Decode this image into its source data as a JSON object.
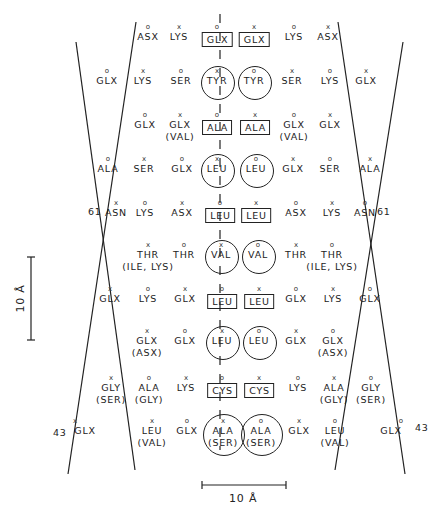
{
  "figure": {
    "type": "helical wheel / residue packing diagram (two antiparallel strands with mirror axis)",
    "marker_legend": {
      "o": "circle-marker",
      "x": "cross-marker"
    },
    "style": {
      "line_color": "#222222",
      "background": "#ffffff"
    }
  },
  "lines": {
    "left_strand_A": {
      "x1": 76,
      "y1": 42,
      "x2": 135,
      "y2": 470
    },
    "left_strand_B": {
      "x1": 136,
      "y1": 22,
      "x2": 68,
      "y2": 474
    },
    "right_strand_A": {
      "x1": 338,
      "y1": 22,
      "x2": 405,
      "y2": 474
    },
    "right_strand_B": {
      "x1": 403,
      "y1": 42,
      "x2": 335,
      "y2": 470
    },
    "center_axis": {
      "x": 220,
      "y1": 14,
      "y2": 450,
      "style": "dashed"
    }
  },
  "position_labels": {
    "left_61": "61",
    "right_61": "61",
    "left_43": "43",
    "right_43": "43"
  },
  "scale_bars": {
    "vertical": {
      "label": "10 Å",
      "x": 31,
      "y1": 257,
      "y2": 340
    },
    "horizontal": {
      "label": "10 Å",
      "x1": 202,
      "x2": 286,
      "y": 485
    }
  },
  "residues": [
    {
      "id": "r1",
      "x": 148,
      "y": 34,
      "mark": "o",
      "name": "ASX"
    },
    {
      "id": "r2",
      "x": 179,
      "y": 34,
      "mark": "x",
      "name": "LYS"
    },
    {
      "id": "r3",
      "x": 217,
      "y": 34,
      "mark": "o",
      "name": "GLX",
      "frame": "box",
      "side": "left"
    },
    {
      "id": "r4",
      "x": 254,
      "y": 34,
      "mark": "x",
      "name": "GLX",
      "frame": "box",
      "side": "right"
    },
    {
      "id": "r5",
      "x": 294,
      "y": 34,
      "mark": "o",
      "name": "LYS"
    },
    {
      "id": "r6",
      "x": 328,
      "y": 34,
      "mark": "x",
      "name": "ASX"
    },
    {
      "id": "r7",
      "x": 107,
      "y": 78,
      "mark": "o",
      "name": "GLX"
    },
    {
      "id": "r8",
      "x": 143,
      "y": 78,
      "mark": "x",
      "name": "LYS"
    },
    {
      "id": "r9",
      "x": 181,
      "y": 78,
      "mark": "o",
      "name": "SER"
    },
    {
      "id": "r10",
      "x": 217,
      "y": 78,
      "mark": "x",
      "name": "TYR",
      "frame": "circle"
    },
    {
      "id": "r11",
      "x": 254,
      "y": 78,
      "mark": "o",
      "name": "TYR",
      "frame": "circle"
    },
    {
      "id": "r12",
      "x": 292,
      "y": 78,
      "mark": "x",
      "name": "SER"
    },
    {
      "id": "r13",
      "x": 330,
      "y": 78,
      "mark": "o",
      "name": "LYS"
    },
    {
      "id": "r14",
      "x": 366,
      "y": 78,
      "mark": "x",
      "name": "GLX"
    },
    {
      "id": "r15",
      "x": 145,
      "y": 122,
      "mark": "o",
      "name": "GLX"
    },
    {
      "id": "r16",
      "x": 180,
      "y": 122,
      "mark": "x",
      "name": "GLX",
      "alt": "(VAL)"
    },
    {
      "id": "r17",
      "x": 217,
      "y": 122,
      "mark": "o",
      "name": "ALA",
      "frame": "box"
    },
    {
      "id": "r18",
      "x": 255,
      "y": 122,
      "mark": "x",
      "name": "ALA",
      "frame": "box"
    },
    {
      "id": "r19",
      "x": 294,
      "y": 122,
      "mark": "o",
      "name": "GLX",
      "alt": "(VAL)"
    },
    {
      "id": "r20",
      "x": 330,
      "y": 122,
      "mark": "x",
      "name": "GLX"
    },
    {
      "id": "r21",
      "x": 108,
      "y": 166,
      "mark": "o",
      "name": "ALA"
    },
    {
      "id": "r22",
      "x": 144,
      "y": 166,
      "mark": "x",
      "name": "SER"
    },
    {
      "id": "r23",
      "x": 182,
      "y": 166,
      "mark": "o",
      "name": "GLX"
    },
    {
      "id": "r24",
      "x": 217,
      "y": 166,
      "mark": "x",
      "name": "LEU",
      "frame": "circle"
    },
    {
      "id": "r25",
      "x": 256,
      "y": 166,
      "mark": "o",
      "name": "LEU",
      "frame": "circle"
    },
    {
      "id": "r26",
      "x": 293,
      "y": 166,
      "mark": "x",
      "name": "GLX"
    },
    {
      "id": "r27",
      "x": 330,
      "y": 166,
      "mark": "o",
      "name": "SER"
    },
    {
      "id": "r28",
      "x": 370,
      "y": 166,
      "mark": "x",
      "name": "ALA"
    },
    {
      "id": "r29",
      "x": 116,
      "y": 210,
      "mark": "x",
      "name": "ASN"
    },
    {
      "id": "r30",
      "x": 145,
      "y": 210,
      "mark": "o",
      "name": "LYS"
    },
    {
      "id": "r31",
      "x": 182,
      "y": 210,
      "mark": "x",
      "name": "ASX"
    },
    {
      "id": "r32",
      "x": 220,
      "y": 210,
      "mark": "o",
      "name": "LEU",
      "frame": "box"
    },
    {
      "id": "r33",
      "x": 256,
      "y": 210,
      "mark": "x",
      "name": "LEU",
      "frame": "box"
    },
    {
      "id": "r34",
      "x": 296,
      "y": 210,
      "mark": "o",
      "name": "ASX"
    },
    {
      "id": "r35",
      "x": 332,
      "y": 210,
      "mark": "x",
      "name": "LYS"
    },
    {
      "id": "r36",
      "x": 365,
      "y": 210,
      "mark": "o",
      "name": "ASN"
    },
    {
      "id": "r37",
      "x": 148,
      "y": 252,
      "mark": "x",
      "name": "THR",
      "alt": "(ILE, LYS)"
    },
    {
      "id": "r38",
      "x": 184,
      "y": 252,
      "mark": "o",
      "name": "THR"
    },
    {
      "id": "r39",
      "x": 221,
      "y": 252,
      "mark": "x",
      "name": "VAL",
      "frame": "circle"
    },
    {
      "id": "r40",
      "x": 258,
      "y": 252,
      "mark": "o",
      "name": "VAL",
      "frame": "circle"
    },
    {
      "id": "r41",
      "x": 296,
      "y": 252,
      "mark": "x",
      "name": "THR"
    },
    {
      "id": "r42",
      "x": 332,
      "y": 252,
      "mark": "o",
      "name": "THR",
      "alt": "(ILE, LYS)"
    },
    {
      "id": "r43",
      "x": 110,
      "y": 296,
      "mark": "x",
      "name": "GLX"
    },
    {
      "id": "r44",
      "x": 148,
      "y": 296,
      "mark": "o",
      "name": "LYS"
    },
    {
      "id": "r45",
      "x": 185,
      "y": 296,
      "mark": "x",
      "name": "GLX"
    },
    {
      "id": "r46",
      "x": 222,
      "y": 296,
      "mark": "o",
      "name": "LEU",
      "frame": "box"
    },
    {
      "id": "r47",
      "x": 259,
      "y": 296,
      "mark": "x",
      "name": "LEU",
      "frame": "box"
    },
    {
      "id": "r48",
      "x": 296,
      "y": 296,
      "mark": "o",
      "name": "GLX"
    },
    {
      "id": "r49",
      "x": 333,
      "y": 296,
      "mark": "x",
      "name": "LYS"
    },
    {
      "id": "r50",
      "x": 370,
      "y": 296,
      "mark": "o",
      "name": "GLX"
    },
    {
      "id": "r51",
      "x": 147,
      "y": 338,
      "mark": "x",
      "name": "GLX",
      "alt": "(ASX)"
    },
    {
      "id": "r52",
      "x": 185,
      "y": 338,
      "mark": "o",
      "name": "GLX"
    },
    {
      "id": "r53",
      "x": 222,
      "y": 338,
      "mark": "x",
      "name": "LEU",
      "frame": "circle"
    },
    {
      "id": "r54",
      "x": 259,
      "y": 338,
      "mark": "o",
      "name": "LEU",
      "frame": "circle"
    },
    {
      "id": "r55",
      "x": 296,
      "y": 338,
      "mark": "x",
      "name": "GLX"
    },
    {
      "id": "r56",
      "x": 333,
      "y": 338,
      "mark": "o",
      "name": "GLX",
      "alt": "(ASX)"
    },
    {
      "id": "r57",
      "x": 111,
      "y": 385,
      "mark": "x",
      "name": "GLY",
      "alt": "(SER)"
    },
    {
      "id": "r58",
      "x": 149,
      "y": 385,
      "mark": "o",
      "name": "ALA",
      "alt": "(GLY)"
    },
    {
      "id": "r59",
      "x": 186,
      "y": 385,
      "mark": "x",
      "name": "LYS"
    },
    {
      "id": "r60",
      "x": 222,
      "y": 385,
      "mark": "o",
      "name": "CYS",
      "frame": "box"
    },
    {
      "id": "r61",
      "x": 259,
      "y": 385,
      "mark": "x",
      "name": "CYS",
      "frame": "box"
    },
    {
      "id": "r62",
      "x": 298,
      "y": 385,
      "mark": "o",
      "name": "LYS"
    },
    {
      "id": "r63",
      "x": 334,
      "y": 385,
      "mark": "x",
      "name": "ALA",
      "alt": "(GLY)"
    },
    {
      "id": "r64",
      "x": 371,
      "y": 385,
      "mark": "o",
      "name": "GLY",
      "alt": "(SER)"
    },
    {
      "id": "r65",
      "x": 85,
      "y": 428,
      "mark": "x",
      "name": "GLX",
      "mark_dx": -10
    },
    {
      "id": "r66",
      "x": 152,
      "y": 428,
      "mark": "x",
      "name": "LEU",
      "alt": "(VAL)"
    },
    {
      "id": "r67",
      "x": 187,
      "y": 428,
      "mark": "o",
      "name": "GLX"
    },
    {
      "id": "r68",
      "x": 223,
      "y": 428,
      "mark": "x",
      "name": "ALA",
      "alt": "(SER)",
      "frame": "circle"
    },
    {
      "id": "r69",
      "x": 261,
      "y": 428,
      "mark": "o",
      "name": "ALA",
      "alt": "(SER)",
      "frame": "circle"
    },
    {
      "id": "r70",
      "x": 299,
      "y": 428,
      "mark": "x",
      "name": "GLX"
    },
    {
      "id": "r71",
      "x": 335,
      "y": 428,
      "mark": "o",
      "name": "LEU",
      "alt": "(VAL)"
    },
    {
      "id": "r72",
      "x": 391,
      "y": 428,
      "mark": "o",
      "name": "GLX",
      "mark_dx": 10
    }
  ]
}
